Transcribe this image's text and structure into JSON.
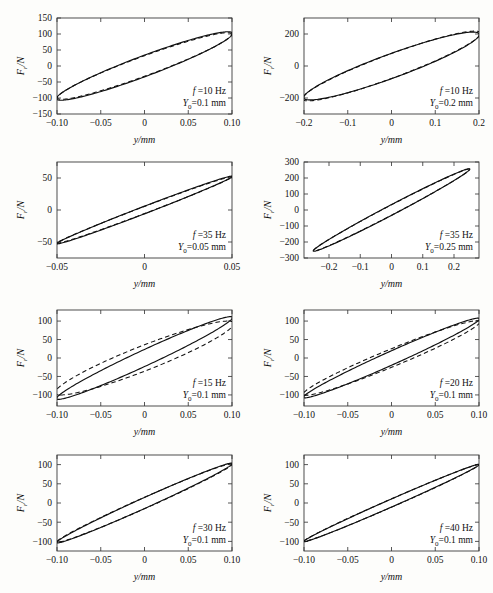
{
  "figure": {
    "axis": {
      "xlabel": "y/mm",
      "ylabel_main": "F",
      "ylabel_sub": "r",
      "ylabel_tail": "/N"
    },
    "legend_keys": {
      "freq_prefix": "f",
      "freq_eq": "=",
      "amp_prefix": "Y",
      "amp_sub": "0",
      "amp_eq": "="
    }
  },
  "chart_data": [
    {
      "type": "line",
      "id": "panel-10hz-01",
      "title": "",
      "xlabel": "y/mm",
      "ylabel": "Fr/N",
      "xlim": [
        -0.1,
        0.1
      ],
      "ylim": [
        -150,
        150
      ],
      "xticks": [
        -0.1,
        -0.05,
        0,
        0.05,
        0.1
      ],
      "xticklabels": [
        "−0.10",
        "−0.05",
        "0",
        "0.05",
        "0.10"
      ],
      "yticks": [
        -150,
        -100,
        -50,
        0,
        50,
        100,
        150
      ],
      "yticklabels": [
        "−150",
        "−100",
        "−50",
        "0",
        "50",
        "100",
        "150"
      ],
      "grid": false,
      "annotations": [
        "f =10 Hz",
        "Y₀=0.1 mm"
      ],
      "frequency_hz": 10,
      "amplitude_mm": 0.1,
      "series": [
        {
          "name": "experiment",
          "style": "solid",
          "ellipse": {
            "a": 0.1005,
            "b": 107,
            "tilt_deg": 18.5,
            "phase_deg": 0
          }
        },
        {
          "name": "model",
          "style": "dashed",
          "ellipse": {
            "a": 0.0995,
            "b": 104,
            "tilt_deg": 18.0,
            "phase_deg": 0
          }
        }
      ]
    },
    {
      "type": "line",
      "id": "panel-10hz-02",
      "title": "",
      "xlabel": "y/mm",
      "ylabel": "Fr/N",
      "xlim": [
        -0.2,
        0.2
      ],
      "ylim": [
        -300,
        300
      ],
      "xticks": [
        -0.2,
        -0.1,
        0,
        0.1,
        0.2
      ],
      "xticklabels": [
        "−0.2",
        "−0.1",
        "0",
        "0.1",
        "0.2"
      ],
      "yticks": [
        -200,
        0,
        200
      ],
      "yticklabels": [
        "−200",
        "0",
        "200"
      ],
      "grid": false,
      "annotations": [
        "f =10 Hz",
        "Y₀=0.2 mm"
      ],
      "frequency_hz": 10,
      "amplitude_mm": 0.2,
      "series": [
        {
          "name": "experiment",
          "style": "solid",
          "ellipse": {
            "a": 0.2005,
            "b": 212,
            "tilt_deg": 22.0,
            "phase_deg": 0
          }
        },
        {
          "name": "model",
          "style": "dashed",
          "ellipse": {
            "a": 0.2035,
            "b": 218,
            "tilt_deg": 21.0,
            "phase_deg": 0
          }
        }
      ]
    },
    {
      "type": "line",
      "id": "panel-35hz-005",
      "title": "",
      "xlabel": "y/mm",
      "ylabel": "Fr/N",
      "xlim": [
        -0.05,
        0.05
      ],
      "ylim": [
        -75,
        75
      ],
      "xticks": [
        -0.05,
        0,
        0.05
      ],
      "xticklabels": [
        "−0.05",
        "0",
        "0.05"
      ],
      "yticks": [
        -50,
        0,
        50
      ],
      "yticklabels": [
        "−50",
        "0",
        "50"
      ],
      "grid": false,
      "annotations": [
        "f =35 Hz",
        "Y₀=0.05 mm"
      ],
      "frequency_hz": 35,
      "amplitude_mm": 0.05,
      "series": [
        {
          "name": "experiment",
          "style": "solid",
          "ellipse": {
            "a": 0.0502,
            "b": 53,
            "tilt_deg": 6.5,
            "phase_deg": 0
          }
        },
        {
          "name": "model",
          "style": "dashed",
          "ellipse": {
            "a": 0.05,
            "b": 52,
            "tilt_deg": 6.2,
            "phase_deg": 0
          }
        }
      ]
    },
    {
      "type": "line",
      "id": "panel-35hz-025",
      "title": "",
      "xlabel": "y/mm",
      "ylabel": "Fr/N",
      "xlim": [
        -0.28,
        0.28
      ],
      "ylim": [
        -300,
        300
      ],
      "xticks": [
        -0.2,
        -0.1,
        0,
        0.1,
        0.2
      ],
      "xticklabels": [
        "−0.2",
        "−0.1",
        "0",
        "0.1",
        "0.2"
      ],
      "yticks": [
        -300,
        -200,
        -100,
        0,
        100,
        200,
        300
      ],
      "yticklabels": [
        "−300",
        "−200",
        "−100",
        "0",
        "100",
        "200",
        "300"
      ],
      "grid": false,
      "annotations": [
        "f =35 Hz",
        "Y₀=0.25 mm"
      ],
      "frequency_hz": 35,
      "amplitude_mm": 0.25,
      "series": [
        {
          "name": "experiment",
          "style": "solid",
          "ellipse": {
            "a": 0.2505,
            "b": 258,
            "tilt_deg": 7.5,
            "phase_deg": 0
          }
        },
        {
          "name": "model",
          "style": "dashed",
          "ellipse": {
            "a": 0.25,
            "b": 256,
            "tilt_deg": 7.3,
            "phase_deg": 0
          }
        }
      ]
    },
    {
      "type": "line",
      "id": "panel-15hz-01",
      "title": "",
      "xlabel": "y/mm",
      "ylabel": "Fr/N",
      "xlim": [
        -0.1,
        0.1
      ],
      "ylim": [
        -130,
        130
      ],
      "xticks": [
        -0.1,
        -0.05,
        0,
        0.05,
        0.1
      ],
      "xticklabels": [
        "−0.10",
        "−0.05",
        "0",
        "0.05",
        "0.10"
      ],
      "yticks": [
        -100,
        -50,
        0,
        50,
        100
      ],
      "yticklabels": [
        "−100",
        "−50",
        "0",
        "50",
        "100"
      ],
      "grid": false,
      "annotations": [
        "f =15 Hz",
        "Y₀=0.1 mm"
      ],
      "frequency_hz": 15,
      "amplitude_mm": 0.1,
      "series": [
        {
          "name": "experiment",
          "style": "solid",
          "ellipse": {
            "a": 0.1005,
            "b": 112,
            "tilt_deg": 12.0,
            "phase_deg": 0
          }
        },
        {
          "name": "model",
          "style": "dashed",
          "ellipse": {
            "a": 0.102,
            "b": 100,
            "tilt_deg": 21.0,
            "phase_deg": 0
          }
        }
      ]
    },
    {
      "type": "line",
      "id": "panel-20hz-01",
      "title": "",
      "xlabel": "y/mm",
      "ylabel": "Fr/N",
      "xlim": [
        -0.1,
        0.1
      ],
      "ylim": [
        -130,
        130
      ],
      "xticks": [
        -0.1,
        -0.05,
        0,
        0.05,
        0.1
      ],
      "xticklabels": [
        "−0.10",
        "−0.05",
        "0",
        "0.05",
        "0.10"
      ],
      "yticks": [
        -100,
        -50,
        0,
        50,
        100
      ],
      "yticklabels": [
        "−100",
        "−50",
        "0",
        "50",
        "100"
      ],
      "grid": false,
      "annotations": [
        "f =20 Hz",
        "Y₀=0.1 mm"
      ],
      "frequency_hz": 20,
      "amplitude_mm": 0.1,
      "series": [
        {
          "name": "experiment",
          "style": "solid",
          "ellipse": {
            "a": 0.1005,
            "b": 108,
            "tilt_deg": 10.5,
            "phase_deg": 0
          }
        },
        {
          "name": "model",
          "style": "dashed",
          "ellipse": {
            "a": 0.101,
            "b": 101,
            "tilt_deg": 14.5,
            "phase_deg": 0
          }
        }
      ]
    },
    {
      "type": "line",
      "id": "panel-30hz-01",
      "title": "",
      "xlabel": "y/mm",
      "ylabel": "Fr/N",
      "xlim": [
        -0.1,
        0.1
      ],
      "ylim": [
        -125,
        125
      ],
      "xticks": [
        -0.1,
        -0.05,
        0,
        0.05,
        0.1
      ],
      "xticklabels": [
        "−0.10",
        "−0.05",
        "0",
        "0.05",
        "0.10"
      ],
      "yticks": [
        -100,
        -50,
        0,
        50,
        100
      ],
      "yticklabels": [
        "−100",
        "−50",
        "0",
        "50",
        "100"
      ],
      "grid": false,
      "annotations": [
        "f =30 Hz",
        "Y₀=0.1 mm"
      ],
      "frequency_hz": 30,
      "amplitude_mm": 0.1,
      "series": [
        {
          "name": "experiment",
          "style": "solid",
          "ellipse": {
            "a": 0.1005,
            "b": 104,
            "tilt_deg": 8.0,
            "phase_deg": 0
          }
        },
        {
          "name": "model",
          "style": "dashed",
          "ellipse": {
            "a": 0.1,
            "b": 102,
            "tilt_deg": 8.4,
            "phase_deg": 0
          }
        }
      ]
    },
    {
      "type": "line",
      "id": "panel-40hz-01",
      "title": "",
      "xlabel": "y/mm",
      "ylabel": "Fr/N",
      "xlim": [
        -0.1,
        0.1
      ],
      "ylim": [
        -125,
        125
      ],
      "xticks": [
        -0.1,
        -0.05,
        0,
        0.05,
        0.1
      ],
      "xticklabels": [
        "−0.10",
        "−0.05",
        "0",
        "0.05",
        "0.10"
      ],
      "yticks": [
        -100,
        -50,
        0,
        50,
        100
      ],
      "yticklabels": [
        "−100",
        "−50",
        "0",
        "50",
        "100"
      ],
      "grid": false,
      "annotations": [
        "f =40 Hz",
        "Y₀=0.1 mm"
      ],
      "frequency_hz": 40,
      "amplitude_mm": 0.1,
      "series": [
        {
          "name": "experiment",
          "style": "solid",
          "ellipse": {
            "a": 0.1005,
            "b": 101,
            "tilt_deg": 6.0,
            "phase_deg": 0
          }
        },
        {
          "name": "model",
          "style": "dashed",
          "ellipse": {
            "a": 0.1,
            "b": 100,
            "tilt_deg": 6.3,
            "phase_deg": 0
          }
        }
      ]
    }
  ],
  "layout": {
    "panel_positions": [
      {
        "left": 0,
        "top": 4
      },
      {
        "left": 247,
        "top": 4
      },
      {
        "left": 0,
        "top": 148
      },
      {
        "left": 247,
        "top": 148
      },
      {
        "left": 0,
        "top": 296
      },
      {
        "left": 247,
        "top": 296
      },
      {
        "left": 0,
        "top": 441
      },
      {
        "left": 247,
        "top": 441
      }
    ]
  }
}
